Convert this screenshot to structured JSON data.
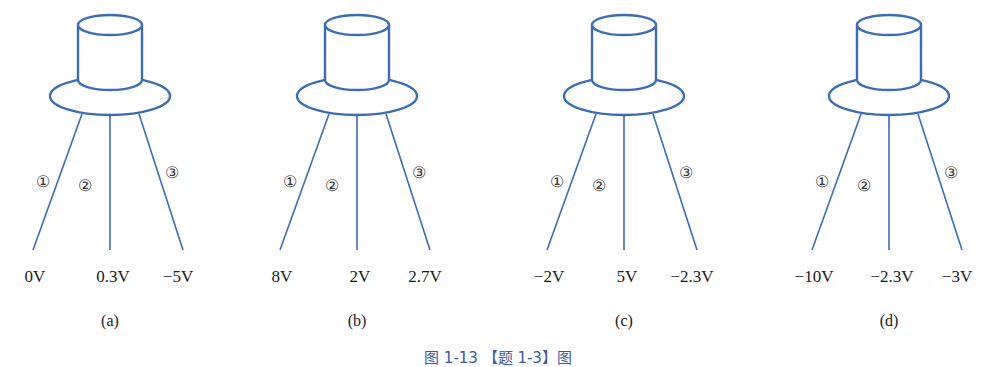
{
  "colors": {
    "stroke": "#3b6cb4",
    "text": "#1a1a1a",
    "caption": "#3a5aa8"
  },
  "figure_caption": "图 1-13 【题 1-3】图",
  "pin_markers": [
    "①",
    "②",
    "③"
  ],
  "panels": [
    {
      "id": "a",
      "label": "(a)",
      "cx": 110,
      "pins": [
        "0V",
        "0.3V",
        "−5V"
      ]
    },
    {
      "id": "b",
      "label": "(b)",
      "cx": 357,
      "pins": [
        "8V",
        "2V",
        "2.7V"
      ]
    },
    {
      "id": "c",
      "label": "(c)",
      "cx": 624,
      "pins": [
        "−2V",
        "5V",
        "−2.3V"
      ]
    },
    {
      "id": "d",
      "label": "(d)",
      "cx": 889,
      "pins": [
        "−10V",
        "−2.3V",
        "−3V"
      ]
    }
  ]
}
